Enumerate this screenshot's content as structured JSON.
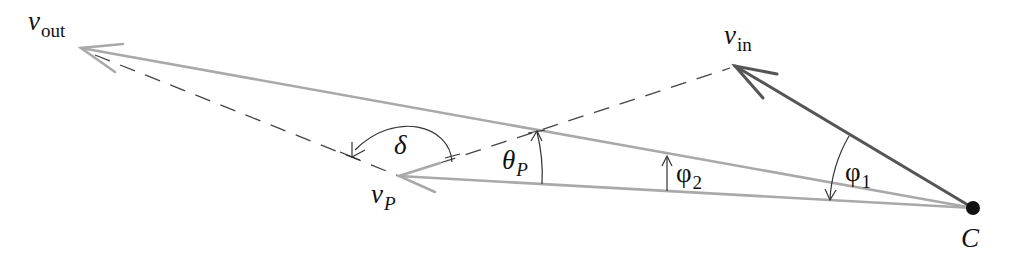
{
  "diagram": {
    "vectors": [
      {
        "id": "v_out",
        "symbol": "v",
        "subscript": "out",
        "from": [
          973,
          208
        ],
        "to": [
          81,
          48
        ],
        "style": "light-gray"
      },
      {
        "id": "v_in",
        "symbol": "v",
        "subscript": "in",
        "from": [
          973,
          208
        ],
        "to": [
          735,
          66
        ],
        "style": "dark-gray"
      },
      {
        "id": "v_P",
        "symbol": "v",
        "subscript": "P",
        "from": [
          973,
          208
        ],
        "to": [
          399,
          176
        ],
        "style": "light-gray"
      }
    ],
    "dashed_lines": [
      {
        "from": [
          81,
          48
        ],
        "to": [
          399,
          176
        ]
      },
      {
        "from": [
          399,
          176
        ],
        "to": [
          735,
          66
        ]
      }
    ],
    "point": {
      "label": "C",
      "x": 973,
      "y": 208
    },
    "angles": [
      {
        "id": "delta",
        "label": "δ"
      },
      {
        "id": "theta_P",
        "label": "θ",
        "subscript": "P"
      },
      {
        "id": "phi_2",
        "label": "φ",
        "subscript": "2"
      },
      {
        "id": "phi_1",
        "label": "φ",
        "subscript": "1"
      }
    ]
  },
  "labels": {
    "v_out": {
      "main": "v",
      "sub": "out"
    },
    "v_in": {
      "main": "v",
      "sub": "in"
    },
    "v_P": {
      "main": "v",
      "sub": "P"
    },
    "C": "C",
    "delta": "δ",
    "theta_P": {
      "main": "θ",
      "sub": "P"
    },
    "phi_2": {
      "main": "φ",
      "sub": "2"
    },
    "phi_1": {
      "main": "φ",
      "sub": "1"
    }
  },
  "colors": {
    "light_vector": "#a9a9a9",
    "dark_vector": "#555555",
    "dashed": "#444444",
    "text": "#111111"
  }
}
